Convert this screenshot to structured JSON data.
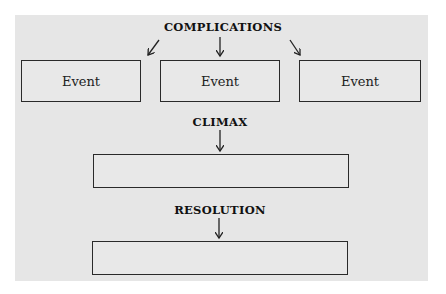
{
  "diagram": {
    "type": "plot-structure-flow",
    "colors": {
      "panel": "#e6e6e6",
      "border": "#2a2a2a",
      "text": "#111111"
    },
    "complications": {
      "heading": "COMPLICATIONS",
      "events": [
        {
          "label": "Event"
        },
        {
          "label": "Event"
        },
        {
          "label": "Event"
        }
      ]
    },
    "climax": {
      "heading": "CLIMAX",
      "box_text": ""
    },
    "resolution": {
      "heading": "RESOLUTION",
      "box_text": ""
    }
  }
}
